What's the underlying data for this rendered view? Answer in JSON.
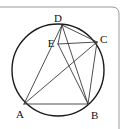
{
  "figure": {
    "background_color": "#ffffff",
    "stroke_color": "#3a3a3a",
    "circle_stroke_color": "#1a1a1a",
    "label_color": "#111111",
    "page_border": {
      "present": true,
      "description": "thin page rule along top edge curving down at top-right corner",
      "color": "#9a9a9a"
    },
    "circle": {
      "name": "circumscribed-circle",
      "cx": 58,
      "cy": 70,
      "r": 46,
      "stroke_width": 1.4
    },
    "points": [
      {
        "id": "A",
        "label": "A",
        "x": 24,
        "y": 104,
        "label_x": 16,
        "label_y": 118,
        "on_circle": true
      },
      {
        "id": "B",
        "label": "B",
        "x": 88,
        "y": 104,
        "label_x": 91,
        "label_y": 119,
        "on_circle": true
      },
      {
        "id": "C",
        "label": "C",
        "x": 97,
        "y": 42,
        "label_x": 100,
        "label_y": 43,
        "on_circle": true
      },
      {
        "id": "D",
        "label": "D",
        "x": 62,
        "y": 25,
        "label_x": 58,
        "label_y": 22,
        "on_circle": true
      },
      {
        "id": "E",
        "label": "E",
        "x": 58,
        "y": 44,
        "label_x": 51,
        "label_y": 47,
        "on_circle": false
      }
    ],
    "segments": [
      {
        "name": "segment-AB",
        "from": "A",
        "to": "B",
        "x1": 24,
        "y1": 104,
        "x2": 88,
        "y2": 104
      },
      {
        "name": "segment-AD",
        "from": "A",
        "to": "D",
        "x1": 24,
        "y1": 104,
        "x2": 62,
        "y2": 25
      },
      {
        "name": "segment-AC",
        "from": "A",
        "to": "C",
        "x1": 24,
        "y1": 104,
        "x2": 97,
        "y2": 42
      },
      {
        "name": "segment-DB",
        "from": "D",
        "to": "B",
        "x1": 62,
        "y1": 25,
        "x2": 88,
        "y2": 104
      },
      {
        "name": "segment-DC",
        "from": "D",
        "to": "C",
        "x1": 62,
        "y1": 25,
        "x2": 97,
        "y2": 42
      },
      {
        "name": "segment-BC",
        "from": "B",
        "to": "C",
        "x1": 88,
        "y1": 104,
        "x2": 97,
        "y2": 42
      },
      {
        "name": "segment-EC",
        "from": "E",
        "to": "C",
        "x1": 58,
        "y1": 44,
        "x2": 97,
        "y2": 42
      },
      {
        "name": "segment-EB",
        "from": "E",
        "to": "B",
        "x1": 58,
        "y1": 44,
        "x2": 88,
        "y2": 104
      },
      {
        "name": "segment-DE",
        "from": "D",
        "to": "E",
        "x1": 62,
        "y1": 25,
        "x2": 58,
        "y2": 44
      }
    ]
  }
}
